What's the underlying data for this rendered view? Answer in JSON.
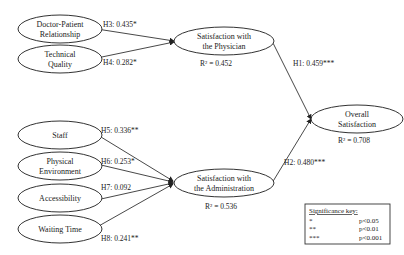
{
  "nodes": {
    "doctor_patient": {
      "line1": "Doctor-Patient",
      "line2": "Relationship"
    },
    "technical_quality": {
      "line1": "Technical",
      "line2": "Quality"
    },
    "staff": {
      "line1": "Staff"
    },
    "physical_environment": {
      "line1": "Physical",
      "line2": "Environment"
    },
    "accessibility": {
      "line1": "Accessibility"
    },
    "waiting_time": {
      "line1": "Waiting Time"
    },
    "sat_physician": {
      "line1": "Satisfaction with",
      "line2": "the Physician",
      "r2": "R² = 0.452"
    },
    "sat_admin": {
      "line1": "Satisfaction with",
      "line2": "the Administration",
      "r2": "R² = 0.536"
    },
    "overall": {
      "line1": "Overall",
      "line2": "Satisfaction",
      "r2": "R² = 0.708"
    }
  },
  "paths": {
    "h1": "H1: 0.459***",
    "h2": "H2: 0.480***",
    "h3": "H3: 0.435*",
    "h4": "H4: 0.282*",
    "h5": "H5: 0.336**",
    "h6": "H6: 0.253*",
    "h7": "H7: 0.092",
    "h8": "H8: 0.241**"
  },
  "significance_key": {
    "title": "Significance key:",
    "rows": [
      {
        "symbol": "*",
        "value": "p<0.05"
      },
      {
        "symbol": "**",
        "value": "p<0.01"
      },
      {
        "symbol": "***",
        "value": "p<0.001"
      }
    ]
  }
}
